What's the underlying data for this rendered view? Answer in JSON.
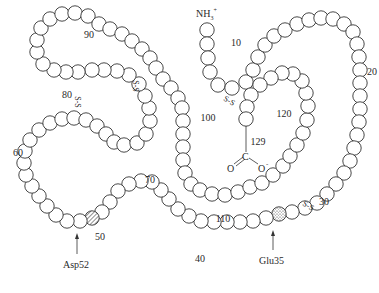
{
  "residue_radius": 7.2,
  "chain": [
    [
      207,
      30
    ],
    [
      207,
      44
    ],
    [
      208,
      58
    ],
    [
      210,
      72
    ],
    [
      218,
      85
    ],
    [
      232,
      88
    ],
    [
      246,
      82
    ],
    [
      253,
      70
    ],
    [
      258,
      57
    ],
    [
      265,
      45
    ],
    [
      274,
      36
    ],
    [
      285,
      30
    ],
    [
      297,
      24
    ],
    [
      309,
      20
    ],
    [
      321,
      18
    ],
    [
      333,
      19
    ],
    [
      344,
      24
    ],
    [
      353,
      32
    ],
    [
      357,
      44
    ],
    [
      359,
      57
    ],
    [
      360,
      70
    ],
    [
      360,
      83
    ],
    [
      360,
      96
    ],
    [
      360,
      109
    ],
    [
      359,
      122
    ],
    [
      357,
      135
    ],
    [
      354,
      148
    ],
    [
      350,
      161
    ],
    [
      344,
      173
    ],
    [
      336,
      184
    ],
    [
      327,
      194
    ],
    [
      317,
      203
    ],
    [
      305,
      208
    ],
    [
      292,
      212
    ],
    [
      279,
      214
    ],
    [
      266,
      218
    ],
    [
      253,
      221
    ],
    [
      240,
      222
    ],
    [
      227,
      222
    ],
    [
      214,
      222
    ],
    [
      201,
      221
    ],
    [
      189,
      216
    ],
    [
      178,
      209
    ],
    [
      169,
      199
    ],
    [
      161,
      190
    ],
    [
      152,
      182
    ],
    [
      141,
      181
    ],
    [
      129,
      184
    ],
    [
      118,
      191
    ],
    [
      110,
      202
    ],
    [
      102,
      212
    ],
    [
      92,
      218
    ],
    [
      80,
      221
    ],
    [
      67,
      221
    ],
    [
      56,
      215
    ],
    [
      47,
      206
    ],
    [
      39,
      196
    ],
    [
      32,
      186
    ],
    [
      26,
      175
    ],
    [
      24,
      163
    ],
    [
      25,
      151
    ],
    [
      30,
      140
    ],
    [
      39,
      130
    ],
    [
      50,
      123
    ],
    [
      62,
      119
    ],
    [
      74,
      118
    ],
    [
      86,
      120
    ],
    [
      97,
      126
    ],
    [
      106,
      134
    ],
    [
      114,
      142
    ],
    [
      124,
      145
    ],
    [
      137,
      143
    ],
    [
      146,
      134
    ],
    [
      150,
      121
    ],
    [
      149,
      108
    ],
    [
      145,
      96
    ],
    [
      139,
      84
    ],
    [
      129,
      75
    ],
    [
      117,
      71
    ],
    [
      104,
      70
    ],
    [
      92,
      70
    ],
    [
      78,
      72
    ],
    [
      66,
      72
    ],
    [
      54,
      70
    ],
    [
      43,
      64
    ],
    [
      37,
      52
    ],
    [
      37,
      40
    ],
    [
      41,
      28
    ],
    [
      50,
      19
    ],
    [
      62,
      14
    ],
    [
      75,
      13
    ],
    [
      88,
      16
    ],
    [
      99,
      24
    ],
    [
      110,
      29
    ],
    [
      122,
      34
    ],
    [
      132,
      41
    ],
    [
      142,
      49
    ],
    [
      150,
      58
    ],
    [
      156,
      68
    ],
    [
      163,
      79
    ],
    [
      171,
      88
    ],
    [
      178,
      98
    ],
    [
      182,
      108
    ],
    [
      183,
      121
    ],
    [
      183,
      134
    ],
    [
      183,
      147
    ],
    [
      183,
      160
    ],
    [
      185,
      173
    ],
    [
      191,
      184
    ],
    [
      200,
      190
    ],
    [
      212,
      194
    ],
    [
      225,
      195
    ],
    [
      238,
      192
    ],
    [
      250,
      187
    ],
    [
      262,
      183
    ],
    [
      273,
      175
    ],
    [
      283,
      166
    ],
    [
      290,
      156
    ],
    [
      297,
      145
    ],
    [
      303,
      133
    ],
    [
      307,
      120
    ],
    [
      308,
      106
    ],
    [
      306,
      93
    ],
    [
      302,
      81
    ],
    [
      293,
      74
    ],
    [
      282,
      73
    ],
    [
      271,
      78
    ],
    [
      260,
      85
    ],
    [
      251,
      95
    ],
    [
      247,
      107
    ],
    [
      246,
      119
    ]
  ],
  "special_residues": [
    {
      "index": 34,
      "name": "Glu35",
      "pattern": "stippled"
    },
    {
      "index": 51,
      "name": "Asp52",
      "pattern": "hatched"
    }
  ],
  "labels": {
    "n_terminus": "NH3+",
    "nh_main": "NH",
    "nh_sub": "3",
    "nh_sup": "+",
    "c_terminus_c": "C",
    "c_terminus_o1": "O",
    "c_terminus_o2": "O",
    "c_terminus_charge": "-",
    "glu35": "Glu35",
    "asp52": "Asp52"
  },
  "residue_numbers": [
    {
      "text": "10",
      "x": 236,
      "y": 46
    },
    {
      "text": "20",
      "x": 372,
      "y": 75
    },
    {
      "text": "30",
      "x": 324,
      "y": 205
    },
    {
      "text": "40",
      "x": 200,
      "y": 262
    },
    {
      "text": "50",
      "x": 100,
      "y": 240
    },
    {
      "text": "60",
      "x": 18,
      "y": 156
    },
    {
      "text": "70",
      "x": 150,
      "y": 183
    },
    {
      "text": "80",
      "x": 67,
      "y": 98
    },
    {
      "text": "90",
      "x": 89,
      "y": 38
    },
    {
      "text": "100",
      "x": 208,
      "y": 121
    },
    {
      "text": "110",
      "x": 223,
      "y": 222
    },
    {
      "text": "120",
      "x": 284,
      "y": 117
    },
    {
      "text": "129",
      "x": 258,
      "y": 145
    }
  ],
  "disulfides": [
    {
      "label": "S-S",
      "x": 228,
      "y": 103,
      "rotate": 30
    },
    {
      "label": "S-S",
      "x": 307,
      "y": 208,
      "rotate": 30
    },
    {
      "label": "S-S",
      "x": 75,
      "y": 102,
      "rotate": 90
    },
    {
      "label": "S-S",
      "x": 133,
      "y": 86,
      "rotate": 90
    }
  ]
}
